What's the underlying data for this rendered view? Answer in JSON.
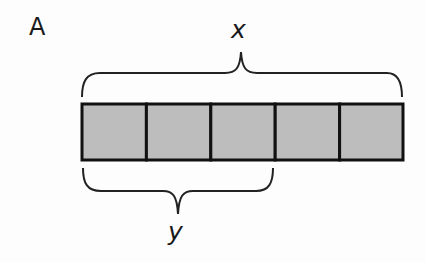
{
  "panel_label": "A",
  "top_brace_label": "x",
  "bottom_brace_label": "y",
  "tape": {
    "segment_count": 5,
    "fill_color": "#bdbdbd",
    "stroke_color": "#111111",
    "segments": [
      {
        "index": 1
      },
      {
        "index": 2
      },
      {
        "index": 3
      },
      {
        "index": 4
      },
      {
        "index": 5
      }
    ]
  },
  "braces": [
    {
      "position": "top",
      "spans_segments": 5,
      "label": "x"
    },
    {
      "position": "bottom",
      "spans_segments": 3,
      "label": "y"
    }
  ]
}
